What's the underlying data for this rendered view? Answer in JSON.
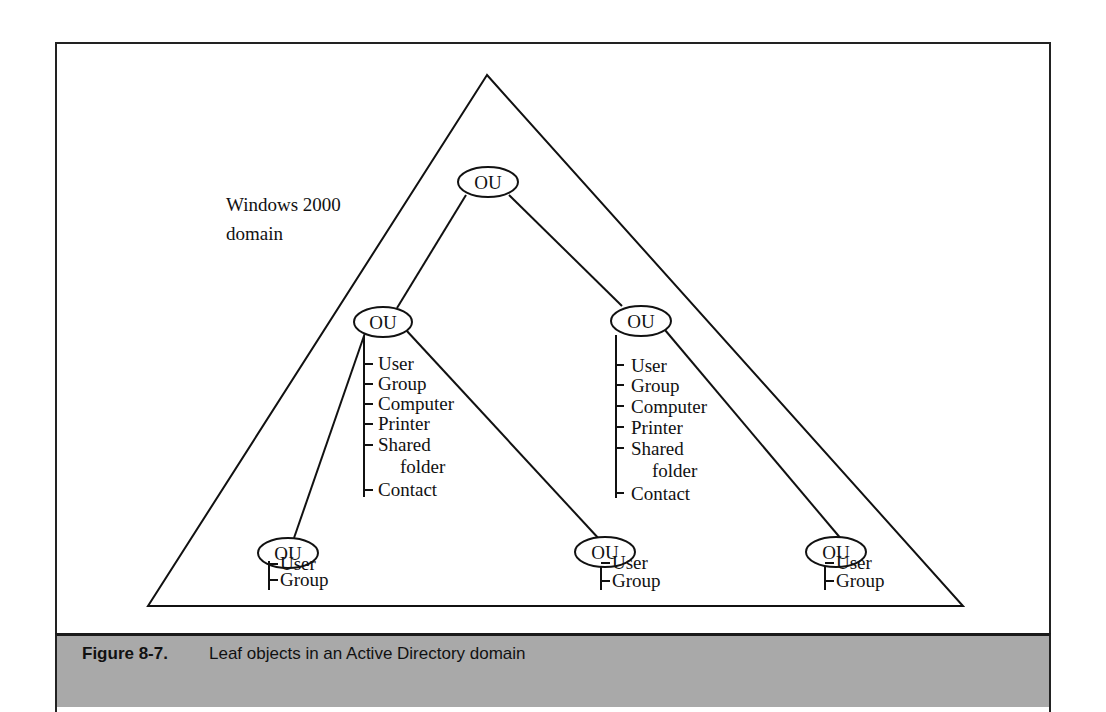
{
  "diagram": {
    "domain_label_line1": "Windows 2000",
    "domain_label_line2": "domain",
    "nodes": {
      "root": {
        "label": "OU"
      },
      "mid_left": {
        "label": "OU",
        "leaves": [
          "User",
          "Group",
          "Computer",
          "Printer",
          "Shared",
          "folder",
          "Contact"
        ]
      },
      "mid_right": {
        "label": "OU",
        "leaves": [
          "User",
          "Group",
          "Computer",
          "Printer",
          "Shared",
          "folder",
          "Contact"
        ]
      },
      "bottom_left": {
        "label": "OU",
        "leaves": [
          "User",
          "Group"
        ]
      },
      "bottom_middle": {
        "label": "OU",
        "leaves": [
          "User",
          "Group"
        ]
      },
      "bottom_right": {
        "label": "OU",
        "leaves": [
          "User",
          "Group"
        ]
      }
    }
  },
  "caption": {
    "figure_number": "Figure 8-7.",
    "text": "Leaf objects in an Active Directory domain"
  },
  "colors": {
    "line": "#111111",
    "caption_background": "#a9a9a9"
  }
}
